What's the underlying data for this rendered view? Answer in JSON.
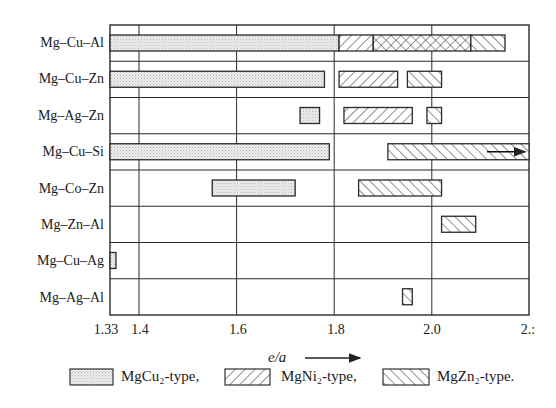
{
  "chart_data": {
    "type": "bar",
    "subtype": "horizontal-range (gantt-like) bar chart",
    "title": "",
    "xlabel": "e/a",
    "ylabel": "",
    "xlim": [
      1.33,
      2.2
    ],
    "x_ticks": [
      "1.33",
      "1.4",
      "1.6",
      "1.8",
      "2.0",
      "2.:"
    ],
    "grid": true,
    "legend_position": "bottom",
    "legend": [
      {
        "key": "MgCu2",
        "label": "MgCu₂-type,",
        "pattern": "dotted-gray"
      },
      {
        "key": "MgNi2",
        "label": "MgNi₂-type,",
        "pattern": "hatch-forward"
      },
      {
        "key": "MgZn2",
        "label": "MgZn₂-type.",
        "pattern": "hatch-back"
      }
    ],
    "categories": [
      "Mg–Cu–Al",
      "Mg–Cu–Zn",
      "Mg–Ag–Zn",
      "Mg–Cu–Si",
      "Mg–Co–Zn",
      "Mg–Zn–Al",
      "Mg–Cu–Ag",
      "Mg–Ag–Al"
    ],
    "rows": [
      {
        "system": "Mg–Cu–Al",
        "ranges": [
          {
            "type": "MgCu2",
            "from": 1.33,
            "to": 1.81
          },
          {
            "type": "MgNi2",
            "from": 1.81,
            "to": 1.88
          },
          {
            "type": "MgNi2+MgZn2",
            "from": 1.88,
            "to": 2.08
          },
          {
            "type": "MgZn2",
            "from": 2.08,
            "to": 2.15
          }
        ]
      },
      {
        "system": "Mg–Cu–Zn",
        "ranges": [
          {
            "type": "MgCu2",
            "from": 1.33,
            "to": 1.78
          },
          {
            "type": "MgNi2",
            "from": 1.81,
            "to": 1.93
          },
          {
            "type": "MgZn2",
            "from": 1.95,
            "to": 2.02
          }
        ]
      },
      {
        "system": "Mg–Ag–Zn",
        "ranges": [
          {
            "type": "MgCu2",
            "from": 1.73,
            "to": 1.77
          },
          {
            "type": "MgNi2",
            "from": 1.82,
            "to": 1.96
          },
          {
            "type": "MgZn2",
            "from": 1.99,
            "to": 2.02
          }
        ]
      },
      {
        "system": "Mg–Cu–Si",
        "ranges": [
          {
            "type": "MgCu2",
            "from": 1.33,
            "to": 1.79
          },
          {
            "type": "MgZn2",
            "from": 1.91,
            "to": 2.2,
            "continues": true
          }
        ]
      },
      {
        "system": "Mg–Co–Zn",
        "ranges": [
          {
            "type": "MgCu2",
            "from": 1.55,
            "to": 1.72
          },
          {
            "type": "MgZn2",
            "from": 1.85,
            "to": 2.02
          }
        ]
      },
      {
        "system": "Mg–Zn–Al",
        "ranges": [
          {
            "type": "MgZn2",
            "from": 2.02,
            "to": 2.09
          }
        ]
      },
      {
        "system": "Mg–Cu–Ag",
        "ranges": [
          {
            "type": "MgCu2",
            "from": 1.33,
            "to": 1.35
          }
        ]
      },
      {
        "system": "Mg–Ag–Al",
        "ranges": [
          {
            "type": "MgZn2",
            "from": 1.94,
            "to": 1.96
          }
        ]
      }
    ]
  },
  "axis": {
    "xlabel": "e/a",
    "ticks": [
      {
        "label": "1.33",
        "value": 1.33
      },
      {
        "label": "1.4",
        "value": 1.4
      },
      {
        "label": "1.6",
        "value": 1.6
      },
      {
        "label": "1.8",
        "value": 1.8
      },
      {
        "label": "2.0",
        "value": 2.0
      },
      {
        "label": "2.:",
        "value": 2.2
      }
    ]
  },
  "rows": {
    "0": "Mg–Cu–Al",
    "1": "Mg–Cu–Zn",
    "2": "Mg–Ag–Zn",
    "3": "Mg–Cu–Si",
    "4": "Mg–Co–Zn",
    "5": "Mg–Zn–Al",
    "6": "Mg–Cu–Ag",
    "7": "Mg–Ag–Al"
  },
  "legend": {
    "mgcu2": "MgCu₂-type,",
    "mgni2": "MgNi₂-type,",
    "mgzn2": "MgZn₂-type."
  },
  "colors": {
    "line": "#2a2a2a",
    "dot_fill": "#e6e6e6",
    "background": "#ffffff"
  }
}
